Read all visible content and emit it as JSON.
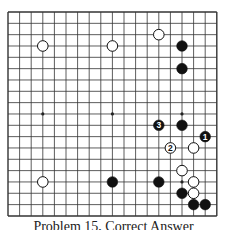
{
  "board": {
    "size": 19,
    "origin_x": 8,
    "origin_y": 12,
    "spacing_x": 11.6,
    "spacing_y": 11.33,
    "line_color": "#333333",
    "hoshi": [
      [
        3,
        3
      ],
      [
        9,
        3
      ],
      [
        15,
        3
      ],
      [
        3,
        9
      ],
      [
        9,
        9
      ],
      [
        15,
        9
      ],
      [
        3,
        15
      ],
      [
        9,
        15
      ],
      [
        15,
        15
      ]
    ]
  },
  "stones": [
    {
      "color": "white",
      "col": 3,
      "row": 3
    },
    {
      "color": "white",
      "col": 9,
      "row": 3
    },
    {
      "color": "white",
      "col": 13,
      "row": 2
    },
    {
      "color": "black",
      "col": 15,
      "row": 3
    },
    {
      "color": "black",
      "col": 15,
      "row": 5
    },
    {
      "color": "black",
      "col": 13,
      "row": 10,
      "label": "3"
    },
    {
      "color": "black",
      "col": 15,
      "row": 10
    },
    {
      "color": "black",
      "col": 17,
      "row": 11,
      "label": "1"
    },
    {
      "color": "white",
      "col": 14,
      "row": 12,
      "label": "2"
    },
    {
      "color": "white",
      "col": 16,
      "row": 12
    },
    {
      "color": "white",
      "col": 15,
      "row": 14
    },
    {
      "color": "white",
      "col": 3,
      "row": 15
    },
    {
      "color": "black",
      "col": 9,
      "row": 15
    },
    {
      "color": "black",
      "col": 13,
      "row": 15
    },
    {
      "color": "white",
      "col": 16,
      "row": 15
    },
    {
      "color": "black",
      "col": 15,
      "row": 16
    },
    {
      "color": "white",
      "col": 16,
      "row": 16
    },
    {
      "color": "black",
      "col": 16,
      "row": 17
    },
    {
      "color": "black",
      "col": 17,
      "row": 17
    }
  ],
  "caption": "Problem 15, Correct Answer"
}
